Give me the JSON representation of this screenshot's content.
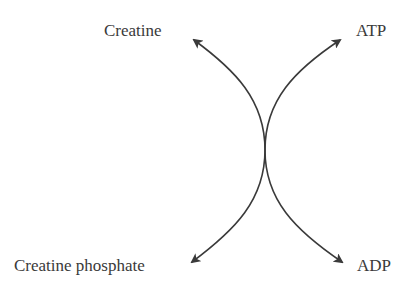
{
  "diagram": {
    "labels": {
      "top_left": "Creatine",
      "top_right": "ATP",
      "bottom_left": "Creatine phosphate",
      "bottom_right": "ADP"
    },
    "colors": {
      "stroke": "#3a3a3a",
      "text": "#3a3a3a"
    }
  }
}
